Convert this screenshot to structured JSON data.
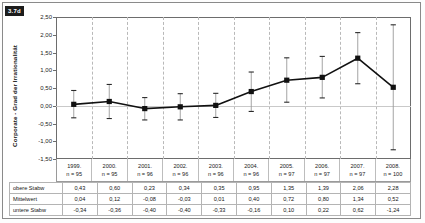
{
  "figure": {
    "tag": "3.7d"
  },
  "chart_data": {
    "type": "line",
    "title": "",
    "subtitle": "",
    "xlabel": "",
    "ylabel": "Corporate - Grad der Irrationalität",
    "ylim": [
      -1.5,
      2.5
    ],
    "ytick_labels": [
      "2,50",
      "2,00",
      "1,50",
      "1,00",
      "0,50",
      "0,00",
      "-0,50",
      "-1,00",
      "-1,50"
    ],
    "ytick_values": [
      2.5,
      2.0,
      1.5,
      1.0,
      0.5,
      0.0,
      -0.5,
      -1.0,
      -1.5
    ],
    "grid": "vertical-dashed",
    "legend": "none",
    "categories": [
      "1999.",
      "2000.",
      "2001.",
      "2002.",
      "2003.",
      "2004.",
      "2005.",
      "2006.",
      "2007.",
      "2008."
    ],
    "category_sublabels": [
      "n = 95",
      "n = 95",
      "n = 96",
      "n = 96",
      "n = 96",
      "n = 96",
      "n = 97",
      "n = 97",
      "n = 97",
      "n = 100"
    ],
    "series": [
      {
        "name": "Mittelwert",
        "values": [
          0.04,
          0.12,
          -0.08,
          -0.03,
          0.01,
          0.4,
          0.72,
          0.8,
          1.34,
          0.52
        ]
      }
    ],
    "error_upper": [
      0.43,
      0.6,
      0.23,
      0.34,
      0.35,
      0.95,
      1.35,
      1.39,
      2.06,
      2.28
    ],
    "error_lower": [
      -0.34,
      -0.36,
      -0.4,
      -0.4,
      -0.33,
      -0.16,
      0.1,
      0.22,
      0.62,
      -1.24
    ],
    "marker": "square",
    "marker_color": "#111111",
    "line_color": "#111111"
  },
  "stats_table": {
    "rows": [
      {
        "label": "obere Stabw",
        "values": [
          "0,43",
          "0,60",
          "0,23",
          "0,34",
          "0,35",
          "0,95",
          "1,35",
          "1,39",
          "2,06",
          "2,28"
        ]
      },
      {
        "label": "Mittelwert",
        "values": [
          "0,04",
          "0,12",
          "-0,08",
          "-0,03",
          "0,01",
          "0,40",
          "0,72",
          "0,80",
          "1,34",
          "0,52"
        ]
      },
      {
        "label": "untere Stabw",
        "values": [
          "-0,34",
          "-0,36",
          "-0,40",
          "-0,40",
          "-0,33",
          "-0,16",
          "0,10",
          "0,22",
          "0,62",
          "-1,24"
        ]
      }
    ]
  }
}
